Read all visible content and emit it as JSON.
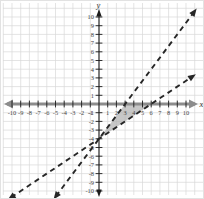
{
  "figure": {
    "kind": "coordinate-plane-graph",
    "background": "#ffffff"
  },
  "chart_data": {
    "type": "line",
    "title": "",
    "xlabel": "x",
    "ylabel": "y",
    "xlim": [
      -10,
      10
    ],
    "ylim": [
      -10,
      10
    ],
    "grid": true,
    "x_ticks": [
      -10,
      -9,
      -8,
      -7,
      -6,
      -5,
      -4,
      -3,
      -2,
      -1,
      1,
      2,
      3,
      4,
      5,
      6,
      7,
      8,
      9,
      10
    ],
    "y_ticks": [
      -10,
      -9,
      -8,
      -7,
      -6,
      -5,
      -4,
      -3,
      -2,
      -1,
      1,
      2,
      3,
      4,
      5,
      6,
      7,
      8,
      9,
      10
    ],
    "series": [
      {
        "name": "line-steep",
        "equation": "y = (4/3)x - 4",
        "slope": 1.3333,
        "intercept": -4,
        "x_intercept": 3,
        "style": "dashed",
        "arrows": "both",
        "color": "#262626",
        "x_start": -4.95,
        "x_end": 10.95
      },
      {
        "name": "line-shallow",
        "equation": "y = (2/3)x - 4",
        "slope": 0.6667,
        "intercept": -4,
        "x_intercept": 6,
        "style": "dashed",
        "arrows": "both",
        "color": "#262626",
        "x_start": -10.1,
        "x_end": 10.75
      }
    ],
    "intersection_point": [
      0,
      -4
    ],
    "shaded_region": {
      "shape": "triangle",
      "vertices": [
        [
          0,
          -4
        ],
        [
          3,
          0
        ],
        [
          6,
          0
        ]
      ],
      "fill": "#afafaf",
      "opacity": 0.7
    },
    "colors": {
      "grid": "#d9d9d9",
      "x_axis": "#8c8c8c",
      "y_axis": "#1c1c1c",
      "tick": "#1c1c1c",
      "tick_text": "#444444",
      "line": "#262626",
      "background": "#ffffff"
    },
    "legend": null
  }
}
